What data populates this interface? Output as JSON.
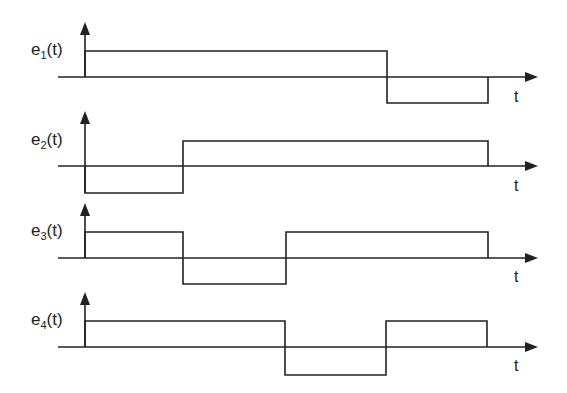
{
  "diagram": {
    "type": "waveform-timing-diagram",
    "x_axis_label": "t",
    "signals": [
      {
        "name": "e",
        "sub": "1",
        "label_suffix": "(t)",
        "levels": [
          1,
          1,
          1,
          -1
        ],
        "transitions_x": [
          85,
          387,
          488
        ]
      },
      {
        "name": "e",
        "sub": "2",
        "label_suffix": "(t)",
        "levels": [
          -1,
          1,
          1,
          1
        ],
        "transitions_x": [
          85,
          183,
          488
        ]
      },
      {
        "name": "e",
        "sub": "3",
        "label_suffix": "(t)",
        "levels": [
          1,
          -1,
          1,
          1
        ],
        "transitions_x": [
          85,
          183,
          286,
          488
        ]
      },
      {
        "name": "e",
        "sub": "4",
        "label_suffix": "(t)",
        "levels": [
          1,
          1,
          -1,
          1
        ],
        "transitions_x": [
          85,
          285,
          386,
          487
        ]
      }
    ]
  },
  "colors": {
    "line": "#222222",
    "background": "#ffffff"
  }
}
